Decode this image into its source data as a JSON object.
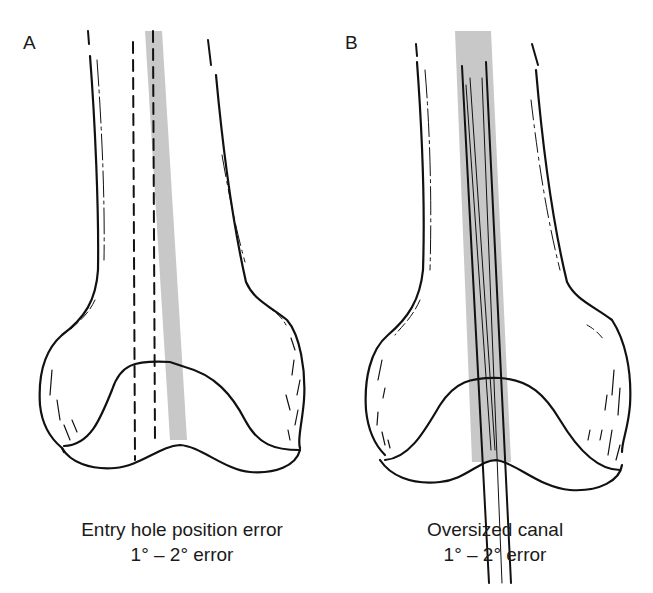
{
  "figure": {
    "panels": [
      {
        "id": "A",
        "label": "A",
        "caption_line1": "Entry hole position error",
        "caption_line2": "1° – 2° error",
        "elements": [
          "distal femur outline",
          "two dashed guide lines (correct entry path)",
          "gray shaded band (actual canal path)"
        ]
      },
      {
        "id": "B",
        "label": "B",
        "caption_line1": "Oversized canal",
        "caption_line2": "1° – 2° error",
        "elements": [
          "distal femur outline",
          "gray shaded band (oversized canal)",
          "rod lines inside canal extending below condyles"
        ]
      }
    ],
    "colors": {
      "line": "#111111",
      "canal_shading": "#c8c8c8",
      "background": "#ffffff"
    }
  }
}
